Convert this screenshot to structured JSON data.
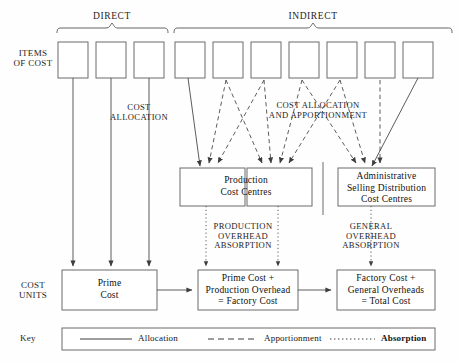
{
  "diagram": {
    "row_labels": {
      "items_of_cost_line1": "ITEMS",
      "items_of_cost_line2": "OF COST",
      "cost_units_line1": "COST",
      "cost_units_line2": "UNITS"
    },
    "group_braces": [
      {
        "id": "direct",
        "label": "DIRECT",
        "x_start": 57,
        "x_end": 168,
        "label_x": 112
      },
      {
        "id": "indirect",
        "label": "INDIRECT",
        "x_start": 174,
        "x_end": 452,
        "label_x": 313
      }
    ],
    "cost_item_boxes": {
      "count": 10,
      "direct_count": 3,
      "indirect_count": 7,
      "boxes": [
        {
          "id": "direct-1",
          "type": "direct",
          "x": 58,
          "label": ""
        },
        {
          "id": "direct-2",
          "type": "direct",
          "x": 96,
          "label": ""
        },
        {
          "id": "direct-3",
          "type": "direct",
          "x": 134,
          "label": ""
        },
        {
          "id": "indirect-1",
          "type": "indirect",
          "x": 175,
          "label": ""
        },
        {
          "id": "indirect-2",
          "type": "indirect",
          "x": 213,
          "label": ""
        },
        {
          "id": "indirect-3",
          "type": "indirect",
          "x": 251,
          "label": ""
        },
        {
          "id": "indirect-4",
          "type": "indirect",
          "x": 289,
          "label": ""
        },
        {
          "id": "indirect-5",
          "type": "indirect",
          "x": 327,
          "label": ""
        },
        {
          "id": "indirect-6",
          "type": "indirect",
          "x": 365,
          "label": ""
        },
        {
          "id": "indirect-7",
          "type": "indirect",
          "x": 403,
          "label": ""
        }
      ]
    },
    "flow_labels": [
      {
        "id": "cost-allocation",
        "lines": [
          "COST",
          "ALLOCATION"
        ],
        "x": 139,
        "y": 103
      },
      {
        "id": "cost-allocation-apportionment",
        "lines": [
          "COST ALLOCATION",
          "AND APPORTIONMENT"
        ],
        "x": 318,
        "y": 101
      },
      {
        "id": "production-overhead-absorption",
        "lines": [
          "PRODUCTION",
          "OVERHEAD",
          "ABSORPTION"
        ],
        "x": 243,
        "y": 222
      },
      {
        "id": "general-overhead-absorption",
        "lines": [
          "GENERAL",
          "OVERHEAD",
          "ABSORPTION"
        ],
        "x": 371,
        "y": 222
      }
    ],
    "cost_centre_boxes": [
      {
        "id": "production-cost-centres",
        "lines": [
          "Production",
          "Cost Centres"
        ]
      },
      {
        "id": "admin-selling-distribution-cost-centres",
        "lines": [
          "Administrative",
          "Selling Distribution",
          "Cost Centres"
        ]
      }
    ],
    "cost_unit_boxes": [
      {
        "id": "prime-cost",
        "lines": [
          "Prime",
          "Cost"
        ]
      },
      {
        "id": "factory-cost",
        "lines": [
          "Prime Cost +",
          "Production Overhead",
          "= Factory Cost"
        ]
      },
      {
        "id": "total-cost",
        "lines": [
          "Factory Cost +",
          "General Overheads",
          "= Total Cost"
        ]
      }
    ],
    "key": {
      "title": "Key",
      "entries": [
        {
          "id": "allocation",
          "label": "Allocation",
          "style": "solid"
        },
        {
          "id": "apportionment",
          "label": "Apportionment",
          "style": "dashed"
        },
        {
          "id": "absorption",
          "label": "Absorption",
          "style": "dotted"
        }
      ]
    },
    "colors": {
      "line": "#4a4a4a",
      "box_border": "#6b6b6b",
      "text": "#1a1a1a",
      "background": "#fefefe"
    }
  }
}
